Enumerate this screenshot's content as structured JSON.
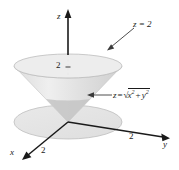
{
  "figure": {
    "type": "3d-cone-diagram",
    "background": "#ffffff",
    "colors": {
      "axis": "#1a1a1a",
      "cone_light": "#e6e6e6",
      "cone_shadow": "#c9c9c9",
      "disk_fill": "#e4e4e4",
      "disk_stroke": "#b5b5b5",
      "label": "#1a1a1a"
    }
  },
  "axes": {
    "z": {
      "label": "z",
      "tick_label": "2"
    },
    "y": {
      "label": "y",
      "tick_label": "2"
    },
    "x": {
      "label": "x",
      "tick_label": "2"
    }
  },
  "annotations": {
    "plane": {
      "text": "z = 2"
    },
    "cone": {
      "lhs": "z",
      "equals": "=",
      "radicand_x": "x",
      "exp_x": "2",
      "plus": "+",
      "radicand_y": "y",
      "exp_y": "2"
    }
  }
}
